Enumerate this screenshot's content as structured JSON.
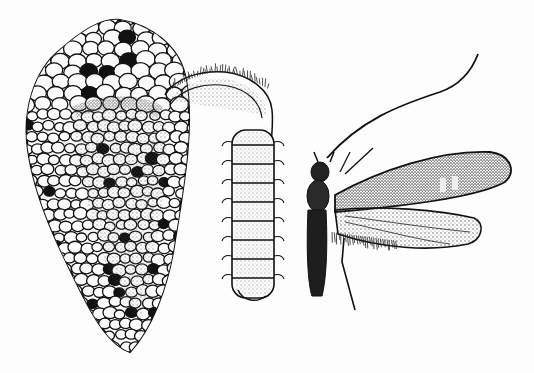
{
  "illustration": {
    "style": "black-and-white engraving",
    "subject": "caddisfly life stages",
    "figures": [
      {
        "id": "case",
        "description": "larval case built of small stones"
      },
      {
        "id": "larva",
        "description": "segmented larva emerging, with bristles"
      },
      {
        "id": "adult",
        "description": "adult caddisfly with long antenna and hairy wings"
      }
    ],
    "colors": {
      "ink": "#111111",
      "paper": "#fdfdfd",
      "stipple": "#555555"
    }
  }
}
